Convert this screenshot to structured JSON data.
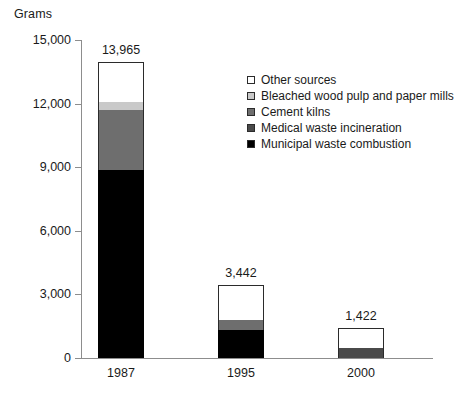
{
  "chart_data": {
    "type": "bar",
    "title": "",
    "subtitle": "",
    "xlabel": "",
    "ylabel": "Grams",
    "ylim": [
      0,
      15000
    ],
    "grid": false,
    "stacked": true,
    "legend_position": "top-right",
    "categories": [
      "1987",
      "1995",
      "2000"
    ],
    "y_ticks": [
      "0",
      "3,000",
      "6,000",
      "9,000",
      "12,000",
      "15,000"
    ],
    "y_tick_values": [
      0,
      3000,
      6000,
      9000,
      12000,
      15000
    ],
    "totals": [
      "13,965",
      "3,442",
      "1,422"
    ],
    "total_values": [
      13965,
      3442,
      1422
    ],
    "series": [
      {
        "name": "Municipal waste combustion",
        "color": "#000000",
        "values": [
          8870,
          1320,
          0
        ]
      },
      {
        "name": "Medical waste incineration",
        "color": "#4a4a4a",
        "values": [
          0,
          0,
          470
        ]
      },
      {
        "name": "Cement kilns",
        "color": "#6e6e6e",
        "values": [
          2830,
          470,
          0
        ]
      },
      {
        "name": "Bleached wood pulp and paper mills",
        "color": "#c9c9c9",
        "values": [
          380,
          0,
          0
        ]
      },
      {
        "name": "Other sources",
        "color": "#ffffff",
        "values": [
          1885,
          1652,
          952
        ]
      }
    ],
    "legend_entries": [
      {
        "label": "Other sources",
        "color": "#ffffff"
      },
      {
        "label": "Bleached wood pulp and paper mills",
        "color": "#c9c9c9"
      },
      {
        "label": "Cement kilns",
        "color": "#6e6e6e"
      },
      {
        "label": "Medical waste incineration",
        "color": "#4a4a4a"
      },
      {
        "label": "Municipal waste combustion",
        "color": "#000000"
      }
    ]
  },
  "axis": {
    "y_title": "Grams"
  }
}
